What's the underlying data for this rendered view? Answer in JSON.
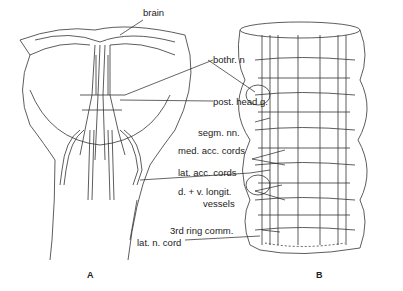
{
  "figure": {
    "panels": [
      {
        "id": "A",
        "label": "A"
      },
      {
        "id": "B",
        "label": "B"
      }
    ],
    "labels": {
      "brain": "brain",
      "bothr_n": "bothr. n",
      "post_head_g": "post. head g.",
      "segm_nn": "segm. nn.",
      "med_acc_cords": "med. acc. cords",
      "lat_acc_cords": "lat. acc. cords",
      "dv_longit_1": "d. + v. longit.",
      "dv_longit_2": "vessels",
      "third_ring_comm": "3rd ring comm.",
      "lat_n_cord": "lat. n. cord"
    }
  }
}
